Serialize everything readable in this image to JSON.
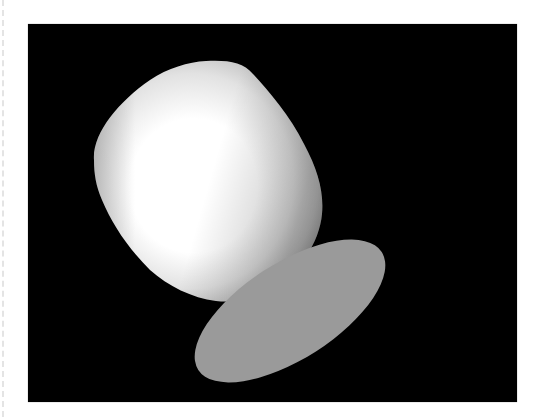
{
  "figure": {
    "background_color": "#000000",
    "page_color": "#ffffff",
    "cup": {
      "highlight_color": "#ffffff",
      "shade_color": "#b8b8b8",
      "edge_color": "#8e8e8e"
    },
    "base_disc": {
      "color": "#9a9a9a",
      "cx": 262,
      "cy": 287,
      "rx": 109,
      "ry": 48,
      "rotation_deg": -32.7
    }
  }
}
